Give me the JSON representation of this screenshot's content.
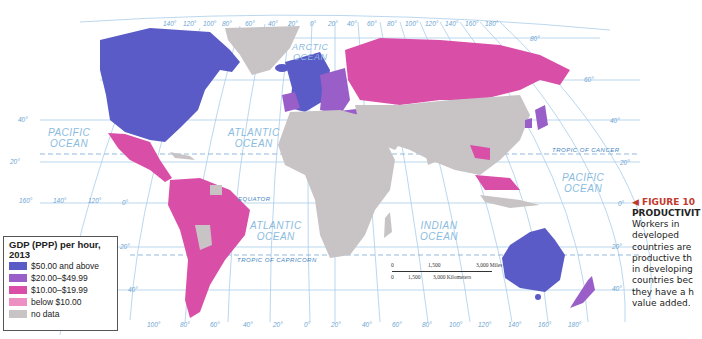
{
  "map": {
    "type": "choropleth",
    "title": "GDP (PPP) per hour, 2013",
    "colors": {
      "ocean": "#ffffff",
      "graticule": "#a9cdea",
      "tropic": "#7aaad4",
      "no_data": "#c8c4c6",
      "tier1": "#5a5bc6",
      "tier2": "#9a5ec9",
      "tier3": "#d94fa8",
      "tier4": "#ee8fc4"
    },
    "oceans": [
      {
        "name": "PACIFIC\nOCEAN",
        "id": "pacific-west"
      },
      {
        "name": "ATLANTIC\nOCEAN",
        "id": "atlantic-north"
      },
      {
        "name": "ARCTIC\nOCEAN",
        "id": "arctic"
      },
      {
        "name": "ATLANTIC\nOCEAN",
        "id": "atlantic-south"
      },
      {
        "name": "INDIAN\nOCEAN",
        "id": "indian"
      },
      {
        "name": "PACIFIC\nOCEAN",
        "id": "pacific-east"
      }
    ],
    "lines": {
      "equator": "EQUATOR",
      "tropic_cancer": "TROPIC OF CANCER",
      "tropic_capricorn": "TROPIC OF CAPRICORN"
    },
    "top_longitudes": [
      "140°",
      "120°",
      "100°",
      "80°",
      "60°",
      "40°",
      "20°",
      "0°",
      "20°",
      "40°",
      "60°",
      "80°",
      "100°",
      "120°",
      "140°",
      "160°",
      "180°"
    ],
    "bottom_longitudes": [
      "100°",
      "80°",
      "60°",
      "40°",
      "20°",
      "0°",
      "20°",
      "40°",
      "60°",
      "80°",
      "100°",
      "120°",
      "140°",
      "160°",
      "180°"
    ],
    "left_bottom_longitudes": [
      "160°",
      "140°",
      "120°"
    ],
    "latitudes_left": [
      "40°",
      "20°",
      "0°",
      "20°",
      "40°"
    ],
    "latitudes_right": [
      "80°",
      "60°",
      "40°",
      "20°",
      "0°",
      "20°",
      "40°"
    ],
    "scale": {
      "miles": [
        "0",
        "1,500",
        "3,000 Miles"
      ],
      "km": [
        "0",
        "1,500",
        "3,000 Kilometers"
      ]
    }
  },
  "legend": {
    "title": "GDP (PPP) per hour, 2013",
    "items": [
      {
        "label": "$50.00 and above",
        "color": "#5a5bc6"
      },
      {
        "label": "$20.00–$49.99",
        "color": "#9a5ec9"
      },
      {
        "label": "$10.00–$19.99",
        "color": "#d94fa8"
      },
      {
        "label": "below $10.00",
        "color": "#ee8fc4"
      },
      {
        "label": "no data",
        "color": "#c8c4c6"
      }
    ]
  },
  "caption": {
    "figure": "◀ FIGURE 10",
    "heading": "PRODUCTIVIT",
    "body": "Workers in\ndeveloped\ncountries are\nproductive th\nin developing\ncountries bec\nthey have a h\nvalue added."
  }
}
